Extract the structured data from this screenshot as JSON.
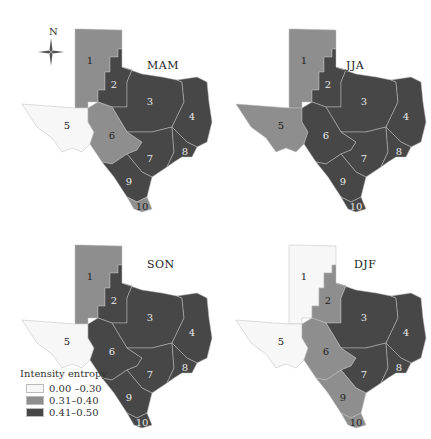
{
  "figure": {
    "compass_label": "N",
    "panels": [
      {
        "season": "MAM",
        "regions": {
          "1": "mid",
          "2": "high",
          "3": "high",
          "4": "high",
          "5": "low",
          "6": "mid",
          "7": "high",
          "8": "high",
          "9": "high",
          "10": "mid"
        }
      },
      {
        "season": "JJA",
        "regions": {
          "1": "mid",
          "2": "high",
          "3": "high",
          "4": "high",
          "5": "mid",
          "6": "high",
          "7": "high",
          "8": "high",
          "9": "high",
          "10": "high"
        }
      },
      {
        "season": "SON",
        "regions": {
          "1": "mid",
          "2": "high",
          "3": "high",
          "4": "high",
          "5": "low",
          "6": "high",
          "7": "high",
          "8": "high",
          "9": "high",
          "10": "high"
        }
      },
      {
        "season": "DJF",
        "regions": {
          "1": "low",
          "2": "mid",
          "3": "high",
          "4": "high",
          "5": "low",
          "6": "mid",
          "7": "high",
          "8": "high",
          "9": "mid",
          "10": "mid"
        }
      }
    ],
    "region_labels": [
      "1",
      "2",
      "3",
      "4",
      "5",
      "6",
      "7",
      "8",
      "9",
      "10"
    ]
  },
  "legend": {
    "title": "Intensity entropy",
    "classes": [
      {
        "key": "low",
        "label": "0.00 –0.30",
        "color": "#f7f7f7"
      },
      {
        "key": "mid",
        "label": "0.31–0.40",
        "color": "#8e8e8e"
      },
      {
        "key": "high",
        "label": "0.41–0.50",
        "color": "#474747"
      }
    ]
  }
}
